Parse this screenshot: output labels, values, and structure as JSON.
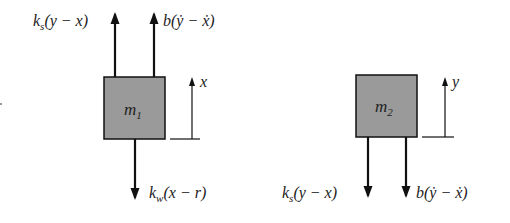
{
  "diagram": {
    "type": "free-body diagram",
    "mass1": {
      "label": "m",
      "subscript": "1",
      "forces": {
        "up_left": {
          "coef": "k",
          "sub": "s",
          "expr": "(y − x)"
        },
        "up_right": {
          "coef": "b",
          "expr": "(ẏ − ẋ)"
        },
        "down": {
          "coef": "k",
          "sub": "w",
          "expr": "(x − r)"
        }
      },
      "displacement": "x"
    },
    "mass2": {
      "label": "m",
      "subscript": "2",
      "forces": {
        "down_left": {
          "coef": "k",
          "sub": "s",
          "expr": "(y − x)"
        },
        "down_right": {
          "coef": "b",
          "expr": "(ẏ − ẋ)"
        }
      },
      "displacement": "y"
    },
    "colors": {
      "box_fill": "#9a9a9a",
      "stroke": "#111111"
    }
  }
}
